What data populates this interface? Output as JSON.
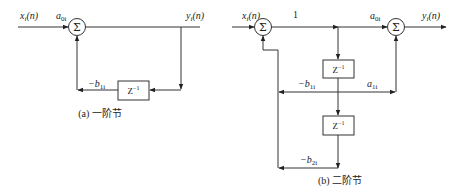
{
  "diagram_a": {
    "caption": "(a) 一阶节",
    "input_label": "x",
    "input_sub": "i",
    "input_arg": "(n)",
    "gain_in": "a",
    "gain_in_sub": "0i",
    "sum_symbol": "Σ",
    "output_label": "y",
    "output_sub": "i",
    "output_arg": "(n)",
    "delay_label": "Z",
    "delay_exp": "−1",
    "feedback_gain": "−b",
    "feedback_gain_sub": "1i"
  },
  "diagram_b": {
    "caption": "(b) 二阶节",
    "input_label": "x",
    "input_sub": "i",
    "input_arg": "(n)",
    "unity_gain": "1",
    "sum_symbol": "Σ",
    "gain_out": "a",
    "gain_out_sub": "0i",
    "output_label": "y",
    "output_sub": "i",
    "output_arg": "(n)",
    "delay1_label": "Z",
    "delay1_exp": "−1",
    "delay2_label": "Z",
    "delay2_exp": "−1",
    "fb1_gain": "−b",
    "fb1_gain_sub": "1i",
    "ff1_gain": "a",
    "ff1_gain_sub": "1i",
    "fb2_gain": "−b",
    "fb2_gain_sub": "2i"
  }
}
